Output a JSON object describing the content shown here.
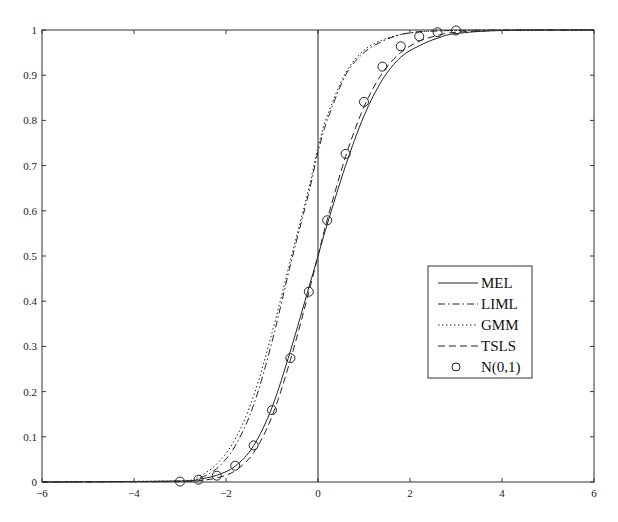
{
  "chart_data": {
    "type": "line",
    "title": "",
    "xlabel": "",
    "ylabel": "",
    "xlim": [
      -6,
      6
    ],
    "ylim": [
      0,
      1
    ],
    "grid": false,
    "legend_position": "center-right inside",
    "x_ticks": [
      "-6",
      "-4",
      "-2",
      "0",
      "2",
      "4",
      "6"
    ],
    "y_ticks": [
      "0",
      "0.1",
      "0.2",
      "0.3",
      "0.4",
      "0.5",
      "0.6",
      "0.7",
      "0.8",
      "0.9",
      "1"
    ],
    "vertical_reference_line_x": 0,
    "series": [
      {
        "name": "MEL",
        "style": "solid",
        "x": [
          -6,
          -3,
          -2.6,
          -2.2,
          -1.8,
          -1.4,
          -1.0,
          -0.6,
          -0.2,
          0,
          0.2,
          0.6,
          1.0,
          1.4,
          1.8,
          2.2,
          2.6,
          3.0,
          4,
          6
        ],
        "y": [
          0,
          0.002,
          0.006,
          0.015,
          0.035,
          0.08,
          0.165,
          0.29,
          0.43,
          0.5,
          0.57,
          0.7,
          0.81,
          0.89,
          0.94,
          0.965,
          0.982,
          0.992,
          0.999,
          1
        ]
      },
      {
        "name": "LIML",
        "style": "dash-dot",
        "x": [
          -6,
          -3,
          -2.6,
          -2.2,
          -1.8,
          -1.4,
          -1.0,
          -0.6,
          -0.2,
          0,
          0.2,
          0.6,
          1.0,
          1.4,
          1.8,
          2.2,
          2.6,
          3.0,
          4,
          6
        ],
        "y": [
          0,
          0.002,
          0.008,
          0.03,
          0.08,
          0.17,
          0.31,
          0.48,
          0.64,
          0.73,
          0.8,
          0.9,
          0.95,
          0.975,
          0.99,
          0.996,
          0.998,
          0.999,
          1,
          1
        ]
      },
      {
        "name": "GMM",
        "style": "dotted",
        "x": [
          -6,
          -3,
          -2.6,
          -2.2,
          -1.8,
          -1.4,
          -1.0,
          -0.6,
          -0.2,
          0,
          0.2,
          0.6,
          1.0,
          1.4,
          1.8,
          2.2,
          2.6,
          3.0,
          4,
          6
        ],
        "y": [
          0,
          0.003,
          0.012,
          0.04,
          0.095,
          0.19,
          0.33,
          0.49,
          0.65,
          0.74,
          0.81,
          0.905,
          0.955,
          0.978,
          0.99,
          0.996,
          0.998,
          0.999,
          1,
          1
        ]
      },
      {
        "name": "TSLS",
        "style": "dashed",
        "x": [
          -6,
          -3,
          -2.6,
          -2.2,
          -1.8,
          -1.4,
          -1.0,
          -0.6,
          -0.2,
          0,
          0.2,
          0.6,
          1.0,
          1.4,
          1.8,
          2.2,
          2.6,
          3.0,
          4,
          6
        ],
        "y": [
          0,
          0.001,
          0.003,
          0.009,
          0.025,
          0.065,
          0.145,
          0.27,
          0.42,
          0.5,
          0.58,
          0.72,
          0.83,
          0.905,
          0.95,
          0.975,
          0.988,
          0.995,
          0.999,
          1
        ]
      },
      {
        "name": "N(0,1)",
        "style": "circle-markers",
        "x": [
          -3.0,
          -2.6,
          -2.2,
          -1.8,
          -1.4,
          -1.0,
          -0.6,
          -0.2,
          0.2,
          0.6,
          1.0,
          1.4,
          1.8,
          2.2,
          2.6,
          3.0
        ],
        "y": [
          0.001,
          0.005,
          0.014,
          0.036,
          0.081,
          0.159,
          0.274,
          0.421,
          0.579,
          0.726,
          0.841,
          0.919,
          0.964,
          0.986,
          0.995,
          0.999
        ]
      }
    ],
    "legend": [
      {
        "label": "MEL",
        "style": "solid"
      },
      {
        "label": "LIML",
        "style": "dash-dot"
      },
      {
        "label": "GMM",
        "style": "dotted"
      },
      {
        "label": "TSLS",
        "style": "dashed"
      },
      {
        "label": "N(0,1)",
        "style": "circle"
      }
    ]
  },
  "colors": {
    "line": "#222222",
    "axis": "#333333",
    "background": "#ffffff"
  }
}
